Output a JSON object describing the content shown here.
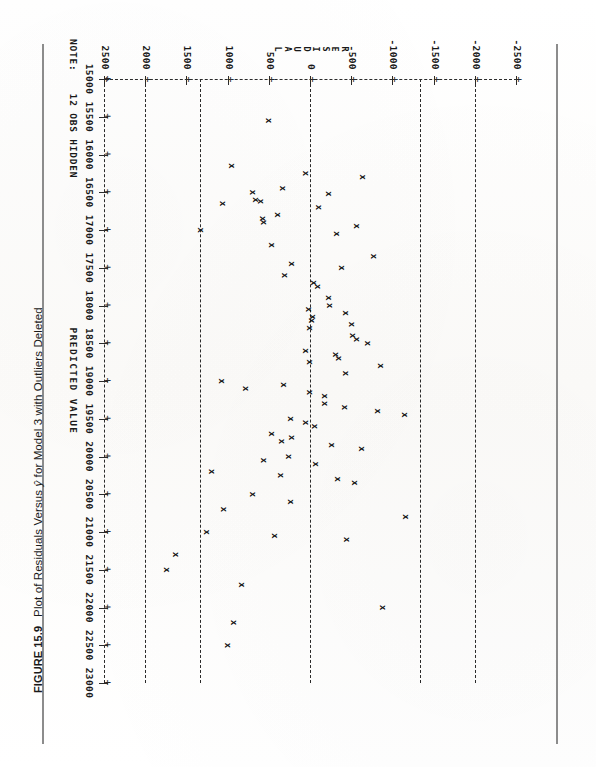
{
  "figure": {
    "number_label": "FIGURE 15.9",
    "caption": "Plot of Residuals Versus ŷ for Model 3 with Outliers Deleted",
    "caption_plain": "Plot of Residuals Versus y-hat for Model 3 with Outliers Deleted"
  },
  "note": {
    "label": "NOTE:",
    "text": "12 OBS HIDDEN"
  },
  "chart_data": {
    "type": "scatter",
    "title": "Plot of Residuals Versus ŷ for Model 3 with Outliers Deleted",
    "xlabel": "PREDICTED VALUE",
    "ylabel": "RESIDUAL",
    "ylabel_letters": [
      "R",
      "E",
      "S",
      "I",
      "D",
      "U",
      "A",
      "L"
    ],
    "marker": "x",
    "grid": "vertical-dashed-reference-lines",
    "legend": "none",
    "xlim": [
      15000,
      23000
    ],
    "ylim": [
      -2500,
      2500
    ],
    "xticks": [
      15000,
      15500,
      16000,
      16500,
      17000,
      17500,
      18000,
      18500,
      19000,
      19500,
      20000,
      20500,
      21000,
      21500,
      22000,
      22500,
      23000
    ],
    "xticklabels": [
      "15000",
      "15500",
      "16000",
      "16500",
      "17000",
      "17500",
      "18000",
      "18500",
      "19000",
      "19500",
      "20000",
      "20500",
      "21000",
      "21500",
      "22000",
      "22500",
      "23000"
    ],
    "yticks": [
      2500,
      2000,
      1500,
      1000,
      500,
      0,
      -500,
      -1000,
      -1500,
      -2000,
      -2500
    ],
    "yticklabels": [
      "2500",
      "2000",
      "1500",
      "1000",
      "500",
      "0",
      "-500",
      "-1000",
      "-1500",
      "-2000",
      "-2500"
    ],
    "reference_lines": [
      {
        "value": 2000,
        "style": "dashed"
      },
      {
        "value": 1340,
        "style": "dashed"
      },
      {
        "value": 0,
        "style": "dashed"
      },
      {
        "value": -1340,
        "style": "dashed"
      },
      {
        "value": -2000,
        "style": "dashed"
      }
    ],
    "annotations": [
      "NOTE: 12 OBS HIDDEN"
    ],
    "points": [
      {
        "x": 15550,
        "y": 500
      },
      {
        "x": 16150,
        "y": 950
      },
      {
        "x": 16250,
        "y": 50
      },
      {
        "x": 16300,
        "y": -640
      },
      {
        "x": 16450,
        "y": 330
      },
      {
        "x": 16500,
        "y": 700
      },
      {
        "x": 16520,
        "y": -230
      },
      {
        "x": 16600,
        "y": 660
      },
      {
        "x": 16620,
        "y": 600
      },
      {
        "x": 16650,
        "y": 1060
      },
      {
        "x": 16700,
        "y": -100
      },
      {
        "x": 16800,
        "y": 400
      },
      {
        "x": 16850,
        "y": 580
      },
      {
        "x": 16900,
        "y": 560
      },
      {
        "x": 16950,
        "y": -560
      },
      {
        "x": 17000,
        "y": 1330
      },
      {
        "x": 17050,
        "y": -320
      },
      {
        "x": 17200,
        "y": 470
      },
      {
        "x": 17350,
        "y": -770
      },
      {
        "x": 17450,
        "y": 230
      },
      {
        "x": 17500,
        "y": -380
      },
      {
        "x": 17600,
        "y": 310
      },
      {
        "x": 17700,
        "y": -40
      },
      {
        "x": 17750,
        "y": -90
      },
      {
        "x": 17900,
        "y": -230
      },
      {
        "x": 18000,
        "y": -240
      },
      {
        "x": 18050,
        "y": 20
      },
      {
        "x": 18100,
        "y": -430
      },
      {
        "x": 18150,
        "y": -30
      },
      {
        "x": 18200,
        "y": -20
      },
      {
        "x": 18250,
        "y": -500
      },
      {
        "x": 18300,
        "y": 10
      },
      {
        "x": 18400,
        "y": -520
      },
      {
        "x": 18450,
        "y": -560
      },
      {
        "x": 18500,
        "y": -700
      },
      {
        "x": 18600,
        "y": 50
      },
      {
        "x": 18650,
        "y": -310
      },
      {
        "x": 18700,
        "y": -340
      },
      {
        "x": 18750,
        "y": 0
      },
      {
        "x": 18800,
        "y": -860
      },
      {
        "x": 18900,
        "y": -430
      },
      {
        "x": 19000,
        "y": 1070
      },
      {
        "x": 19050,
        "y": 320
      },
      {
        "x": 19100,
        "y": 780
      },
      {
        "x": 19150,
        "y": 10
      },
      {
        "x": 19200,
        "y": -170
      },
      {
        "x": 19300,
        "y": -180
      },
      {
        "x": 19350,
        "y": -420
      },
      {
        "x": 19400,
        "y": -820
      },
      {
        "x": 19450,
        "y": -1150
      },
      {
        "x": 19500,
        "y": 240
      },
      {
        "x": 19550,
        "y": 60
      },
      {
        "x": 19600,
        "y": -60
      },
      {
        "x": 19700,
        "y": 470
      },
      {
        "x": 19750,
        "y": 230
      },
      {
        "x": 19800,
        "y": 340
      },
      {
        "x": 19850,
        "y": -260
      },
      {
        "x": 19900,
        "y": -620
      },
      {
        "x": 20000,
        "y": 260
      },
      {
        "x": 20050,
        "y": 560
      },
      {
        "x": 20100,
        "y": -70
      },
      {
        "x": 20200,
        "y": 1200
      },
      {
        "x": 20250,
        "y": 360
      },
      {
        "x": 20300,
        "y": -330
      },
      {
        "x": 20350,
        "y": -540
      },
      {
        "x": 20500,
        "y": 700
      },
      {
        "x": 20600,
        "y": 240
      },
      {
        "x": 20700,
        "y": 1050
      },
      {
        "x": 20800,
        "y": -1160
      },
      {
        "x": 21000,
        "y": 1260
      },
      {
        "x": 21050,
        "y": 430
      },
      {
        "x": 21100,
        "y": -440
      },
      {
        "x": 21300,
        "y": 1630
      },
      {
        "x": 21500,
        "y": 1740
      },
      {
        "x": 21700,
        "y": 830
      },
      {
        "x": 22000,
        "y": -880
      },
      {
        "x": 22200,
        "y": 930
      },
      {
        "x": 22500,
        "y": 1000
      }
    ]
  }
}
